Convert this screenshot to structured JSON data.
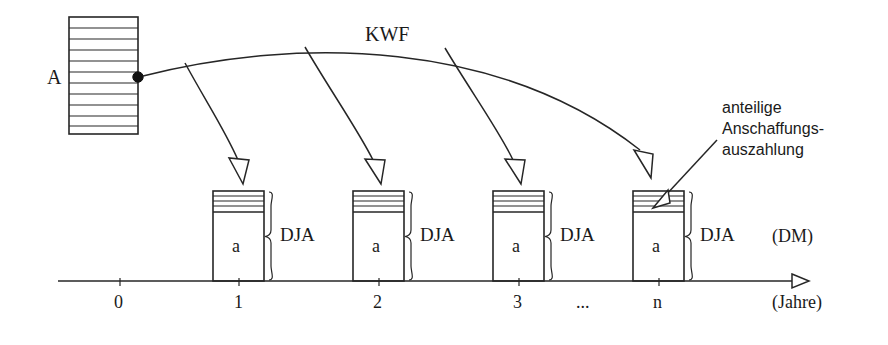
{
  "diagram": {
    "title_hidden": "",
    "initial_outlay": {
      "label": "A",
      "description": "hatched block representing initial investment outlay"
    },
    "factor": {
      "label": "KWF"
    },
    "annotation": {
      "line1": "anteilige",
      "line2": "Anschaffungs-",
      "line3": "auszahlung"
    },
    "bars": [
      {
        "body_label": "a",
        "brace_label": "DJA",
        "tick": "1"
      },
      {
        "body_label": "a",
        "brace_label": "DJA",
        "tick": "2"
      },
      {
        "body_label": "a",
        "brace_label": "DJA",
        "tick": "3"
      },
      {
        "body_label": "a",
        "brace_label": "DJA",
        "tick": "n"
      }
    ],
    "axis": {
      "y_unit_label": "(DM)",
      "x_unit_label": "(Jahre)",
      "ticks": [
        "0",
        "1",
        "2",
        "3",
        "n"
      ],
      "ellipsis": "..."
    },
    "colors": {
      "ink": "#1a1a1a",
      "stroke": "#262626",
      "background": "#ffffff"
    }
  }
}
